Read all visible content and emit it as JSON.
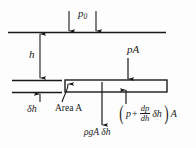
{
  "figure": {
    "background_color": "#fdfdfd",
    "line_color": "#1a1a1a"
  },
  "labels": {
    "surface_pressure": "p",
    "surface_pressure_sub": "0",
    "depth": "h",
    "element_thickness_delta": "δ",
    "element_thickness_var": "h",
    "area_label": "Area A",
    "top_force": "pA",
    "weight": "ρgA δh",
    "bottom_force": {
      "open_paren": "(",
      "p": "p",
      "plus": "+",
      "frac_num": "dp",
      "frac_den": "dh",
      "delta_h": "δh",
      "close_paren": ")",
      "area": "A"
    }
  },
  "geometry": {
    "free_surface_line": {
      "x1": 8,
      "y1": 32,
      "x2": 166,
      "y2": 32
    },
    "slab": {
      "x": 65,
      "y": 80,
      "width": 102,
      "height": 12
    },
    "left_line_top": {
      "x1": 12,
      "y1": 80,
      "x2": 62,
      "y2": 80
    },
    "left_line_bottom": {
      "x1": 12,
      "y1": 92,
      "x2": 62,
      "y2": 92
    },
    "p0_arrows_x": [
      69,
      96
    ],
    "depth_dimension_x": 40,
    "weight_arrow_x": 102,
    "top_force_arrow_x": 128,
    "bottom_force_arrow_x": 126
  }
}
